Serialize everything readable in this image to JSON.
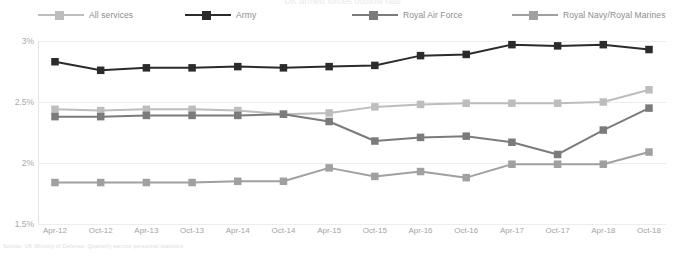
{
  "title_sliver": "UK armed forces outflow rate",
  "source_note": "Source: UK Ministry of Defence, Quarterly service personnel statistics",
  "legend": {
    "items": [
      {
        "label": "All services",
        "color": "#bdbdbd",
        "x": 38
      },
      {
        "label": "Army",
        "color": "#2b2b2b",
        "x": 185
      },
      {
        "label": "Royal Air Force",
        "color": "#7b7b7b",
        "x": 352
      },
      {
        "label": "Royal Navy/Royal Marines",
        "color": "#a0a0a0",
        "x": 512
      }
    ]
  },
  "axis": {
    "y_ticks": [
      "3%",
      "2.5%",
      "2%",
      "1.5%"
    ],
    "y_values": [
      3,
      2.5,
      2,
      1.5
    ],
    "x_ticks": [
      "Apr-12",
      "Oct-12",
      "Apr-13",
      "Oct-13",
      "Apr-14",
      "Oct-14",
      "Apr-15",
      "Oct-15",
      "Apr-16",
      "Oct-16",
      "Apr-17",
      "Oct-17",
      "Apr-18",
      "Oct-18"
    ]
  },
  "chart_data": {
    "type": "line",
    "title": "UK armed forces outflow rate",
    "xlabel": "",
    "ylabel": "",
    "ylim": [
      1.5,
      3.0
    ],
    "grid": true,
    "legend_position": "top",
    "categories": [
      "Apr-12",
      "Oct-12",
      "Apr-13",
      "Oct-13",
      "Apr-14",
      "Oct-14",
      "Apr-15",
      "Oct-15",
      "Apr-16",
      "Oct-16",
      "Apr-17",
      "Oct-17",
      "Apr-18",
      "Oct-18"
    ],
    "series": [
      {
        "name": "All services",
        "color": "#bdbdbd",
        "values": [
          2.44,
          2.43,
          2.44,
          2.44,
          2.43,
          2.4,
          2.41,
          2.46,
          2.48,
          2.49,
          2.49,
          2.49,
          2.5,
          2.6
        ]
      },
      {
        "name": "Army",
        "color": "#2b2b2b",
        "values": [
          2.83,
          2.76,
          2.78,
          2.78,
          2.79,
          2.78,
          2.79,
          2.8,
          2.88,
          2.89,
          2.97,
          2.96,
          2.97,
          2.93
        ]
      },
      {
        "name": "Royal Air Force",
        "color": "#7b7b7b",
        "values": [
          2.38,
          2.38,
          2.39,
          2.39,
          2.39,
          2.4,
          2.34,
          2.18,
          2.21,
          2.22,
          2.17,
          2.07,
          2.27,
          2.45
        ]
      },
      {
        "name": "Royal Navy/Royal Marines",
        "color": "#a0a0a0",
        "values": [
          1.84,
          1.84,
          1.84,
          1.84,
          1.85,
          1.85,
          1.96,
          1.89,
          1.93,
          1.88,
          1.99,
          1.99,
          1.99,
          2.09
        ]
      }
    ]
  }
}
